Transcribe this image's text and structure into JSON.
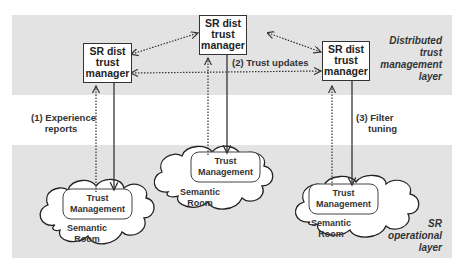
{
  "layers": {
    "top": {
      "label_lines": [
        "Distributed",
        "trust",
        "management",
        "layer"
      ]
    },
    "bottom": {
      "label_lines": [
        "SR",
        "operational",
        "layer"
      ]
    }
  },
  "managers": [
    {
      "id": "left",
      "lines": [
        "SR dist",
        "trust",
        "manager"
      ]
    },
    {
      "id": "center",
      "lines": [
        "SR dist",
        "trust",
        "manager"
      ]
    },
    {
      "id": "right",
      "lines": [
        "SR dist",
        "trust",
        "manager"
      ]
    }
  ],
  "flows": {
    "experience_reports": {
      "lines": [
        "(1) Experience",
        "reports"
      ]
    },
    "trust_updates": {
      "lines": [
        "(2) Trust updates"
      ]
    },
    "filter_tuning": {
      "lines": [
        "(3) Filter",
        "tuning"
      ]
    }
  },
  "rooms": [
    {
      "id": "left",
      "tm_lines": [
        "Trust",
        "Management"
      ],
      "room_lines": [
        "Semantic",
        "Room"
      ]
    },
    {
      "id": "center",
      "tm_lines": [
        "Trust",
        "Management"
      ],
      "room_lines": [
        "Semantic",
        "Room"
      ]
    },
    {
      "id": "right",
      "tm_lines": [
        "Trust",
        "Management"
      ],
      "room_lines": [
        "Semantic",
        "Room"
      ]
    }
  ],
  "colors": {
    "band": "#e3e3e3",
    "line": "#333333",
    "box": "#ffffff"
  }
}
